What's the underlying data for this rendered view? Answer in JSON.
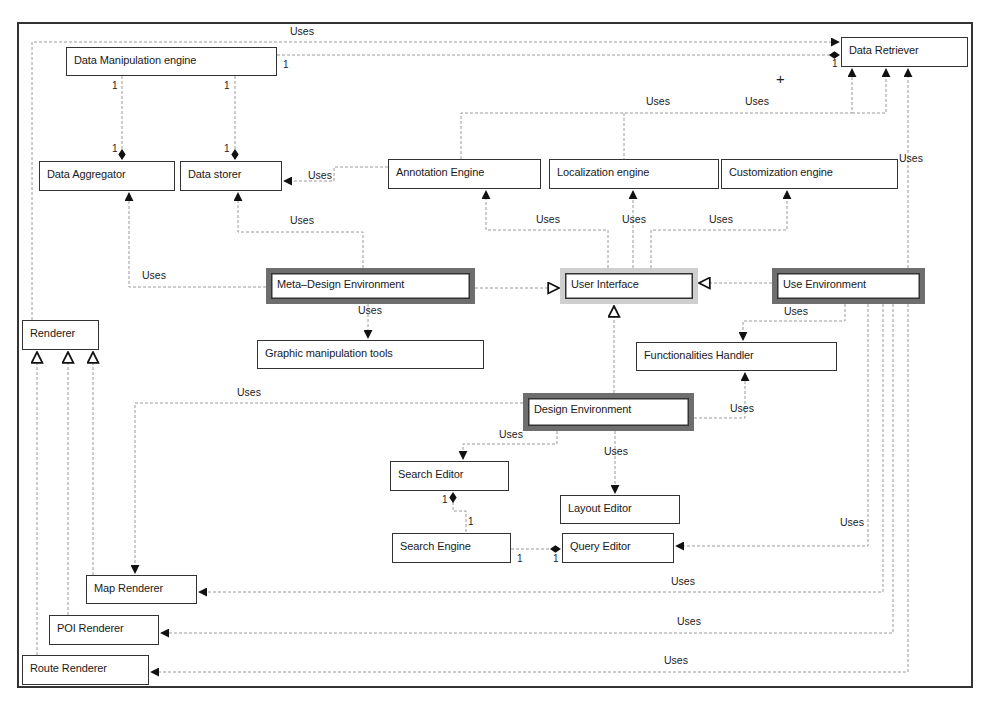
{
  "diagram": {
    "type": "UML class diagram",
    "classes": {
      "data_manipulation_engine": "Data Manipulation engine",
      "data_retriever": "Data Retriever",
      "data_aggregator": "Data Aggregator",
      "data_storer": "Data storer",
      "annotation_engine": "Annotation Engine",
      "localization_engine": "Localization engine",
      "customization_engine": "Customization engine",
      "meta_design_environment": "Meta–Design Environment",
      "user_interface": "User Interface",
      "use_environment": "Use Environment",
      "renderer": "Renderer",
      "graphic_manipulation_tools": "Graphic manipulation tools",
      "functionalities_handler": "Functionalities Handler",
      "design_environment": "Design Environment",
      "search_editor": "Search Editor",
      "layout_editor": "Layout Editor",
      "search_engine": "Search Engine",
      "query_editor": "Query Editor",
      "map_renderer": "Map Renderer",
      "poi_renderer": "POI Renderer",
      "route_renderer": "Route Renderer"
    },
    "relation_label": "Uses",
    "multiplicity": "1",
    "plus_mark": "+",
    "relations": [
      {
        "from": "Data Manipulation engine",
        "to": "Data Retriever",
        "type": "uses"
      },
      {
        "from": "Data Manipulation engine",
        "to": "Data Retriever",
        "type": "composition",
        "mult_from": "1",
        "mult_to": "1"
      },
      {
        "from": "Data Manipulation engine",
        "to": "Data Aggregator",
        "type": "composition",
        "mult_from": "1",
        "mult_to": "1"
      },
      {
        "from": "Data Manipulation engine",
        "to": "Data storer",
        "type": "composition",
        "mult_from": "1",
        "mult_to": "1"
      },
      {
        "from": "Annotation Engine",
        "to": "Data storer",
        "type": "uses"
      },
      {
        "from": "Annotation Engine",
        "to": "Data Retriever",
        "type": "uses"
      },
      {
        "from": "Localization engine",
        "to": "Data Retriever",
        "type": "uses"
      },
      {
        "from": "Customization engine",
        "to": "Data Retriever",
        "type": "uses"
      },
      {
        "from": "Meta–Design Environment",
        "to": "Data Aggregator",
        "type": "uses"
      },
      {
        "from": "Meta–Design Environment",
        "to": "Data storer",
        "type": "uses"
      },
      {
        "from": "Meta–Design Environment",
        "to": "Graphic manipulation tools",
        "type": "uses"
      },
      {
        "from": "Meta–Design Environment",
        "to": "User Interface",
        "type": "generalization"
      },
      {
        "from": "Use Environment",
        "to": "User Interface",
        "type": "generalization"
      },
      {
        "from": "Design Environment",
        "to": "User Interface",
        "type": "generalization"
      },
      {
        "from": "User Interface",
        "to": "Annotation Engine",
        "type": "uses"
      },
      {
        "from": "User Interface",
        "to": "Localization engine",
        "type": "uses"
      },
      {
        "from": "User Interface",
        "to": "Customization engine",
        "type": "uses"
      },
      {
        "from": "Use Environment",
        "to": "Functionalities Handler",
        "type": "uses"
      },
      {
        "from": "Design Environment",
        "to": "Functionalities Handler",
        "type": "uses"
      },
      {
        "from": "Design Environment",
        "to": "Search Editor",
        "type": "uses"
      },
      {
        "from": "Design Environment",
        "to": "Layout Editor",
        "type": "uses"
      },
      {
        "from": "Design Environment",
        "to": "Map Renderer",
        "type": "uses"
      },
      {
        "from": "Search Editor",
        "to": "Search Engine",
        "type": "composition",
        "mult_from": "1",
        "mult_to": "1"
      },
      {
        "from": "Query Editor",
        "to": "Search Engine",
        "type": "composition",
        "mult_from": "1",
        "mult_to": "1"
      },
      {
        "from": "Use Environment",
        "to": "Query Editor",
        "type": "uses"
      },
      {
        "from": "Use Environment",
        "to": "Map Renderer",
        "type": "uses"
      },
      {
        "from": "Use Environment",
        "to": "POI Renderer",
        "type": "uses"
      },
      {
        "from": "Use Environment",
        "to": "Route Renderer",
        "type": "uses"
      },
      {
        "from": "Use Environment",
        "to": "Data Retriever",
        "type": "uses"
      },
      {
        "from": "Map Renderer",
        "to": "Renderer",
        "type": "generalization"
      },
      {
        "from": "POI Renderer",
        "to": "Renderer",
        "type": "generalization"
      },
      {
        "from": "Route Renderer",
        "to": "Renderer",
        "type": "generalization"
      },
      {
        "from": "Renderer",
        "to": "Data Retriever",
        "type": "uses"
      }
    ]
  }
}
